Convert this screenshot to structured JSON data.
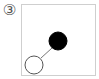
{
  "figure": {
    "label": "③",
    "panel": {
      "border_color": "#cfcfcf",
      "atoms": [
        {
          "name": "filled-atom",
          "cx": 58,
          "cy": 41,
          "r": 9,
          "fill": "#000000",
          "stroke": "#000000"
        },
        {
          "name": "hollow-atom",
          "cx": 34,
          "cy": 65,
          "r": 9,
          "fill": "#ffffff",
          "stroke": "#555555"
        }
      ],
      "bond": {
        "x1": 41,
        "y1": 58,
        "x2": 52,
        "y2": 48,
        "color": "#777777"
      }
    }
  }
}
